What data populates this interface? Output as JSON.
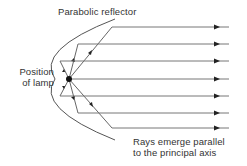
{
  "diagram": {
    "title_label": "Parabolic reflector",
    "lamp_label_line1": "Position",
    "lamp_label_line2": "of lamp",
    "caption_line1": "Rays emerge parallel",
    "caption_line2": "to the principal axis",
    "colors": {
      "line": "#555555",
      "ray": "#777777",
      "lamp": "#111111",
      "text": "#333333"
    },
    "focus": {
      "x": 69,
      "y": 79
    },
    "ray_y": [
      27,
      44,
      61,
      79,
      96,
      113,
      128
    ],
    "ray_x_end": 229,
    "arrow_x": 217
  }
}
